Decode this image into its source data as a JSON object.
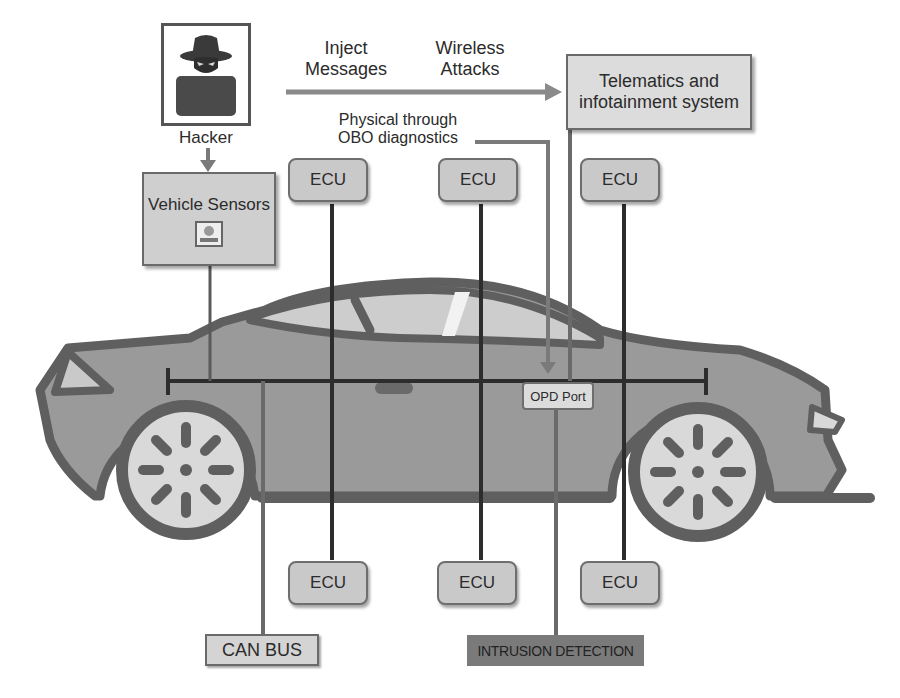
{
  "diagram": {
    "attacker": {
      "label": "Hacker",
      "icon": "hacker-icon"
    },
    "attack_vectors": {
      "inject_messages": "Inject\nMessages",
      "inject_line1": "Inject",
      "inject_line2": "Messages",
      "wireless_line1": "Wireless",
      "wireless_line2": "Attacks",
      "physical_line1": "Physical through",
      "physical_line2": "OBO diagnostics"
    },
    "nodes": {
      "telematics_line1": "Telematics and",
      "telematics_line2": "infotainment system",
      "vehicle_sensors": "Vehicle Sensors",
      "opd_port": "OPD Port",
      "can_bus": "CAN BUS",
      "intrusion_detection": "INTRUSION DETECTION",
      "ecus_top": [
        "ECU",
        "ECU",
        "ECU"
      ],
      "ecus_bottom": [
        "ECU",
        "ECU",
        "ECU"
      ]
    },
    "colors": {
      "car_body": "#9a9a9a",
      "car_outline": "#5f5f5f",
      "window": "#cdcdcd",
      "wheel_rim": "#d9d9d9",
      "box_fill": "#cfcfcf",
      "intrusion_fill": "#7a7a7a",
      "bus_line": "#2d2d2d"
    }
  }
}
